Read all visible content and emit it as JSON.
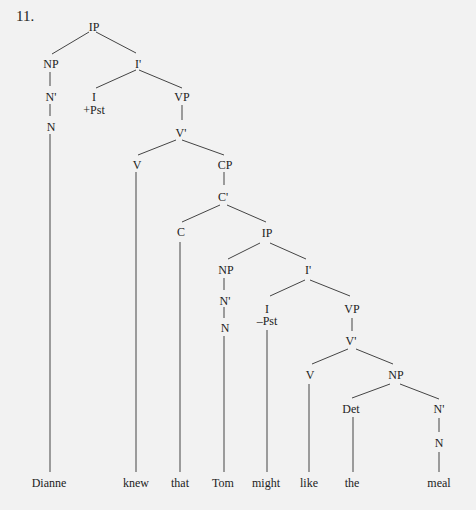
{
  "example_number": "11.",
  "nodes": {
    "ip1": "IP",
    "np1": "NP",
    "ibar1": "I'",
    "nbar1": "N'",
    "n1": "N",
    "i1": "I",
    "i1_feat": "+Pst",
    "vp1": "VP",
    "vbar1": "V'",
    "v1": "V",
    "cp": "CP",
    "cbar": "C'",
    "c": "C",
    "ip2": "IP",
    "np2": "NP",
    "ibar2": "I'",
    "nbar2": "N'",
    "n2": "N",
    "i2": "I",
    "i2_feat": "–Pst",
    "vp2": "VP",
    "vbar2": "V'",
    "v2": "V",
    "np3": "NP",
    "det": "Det",
    "nbar3": "N'",
    "n3": "N"
  },
  "words": [
    "Dianne",
    "knew",
    "that",
    "Tom",
    "might",
    "like",
    "the",
    "meal"
  ]
}
